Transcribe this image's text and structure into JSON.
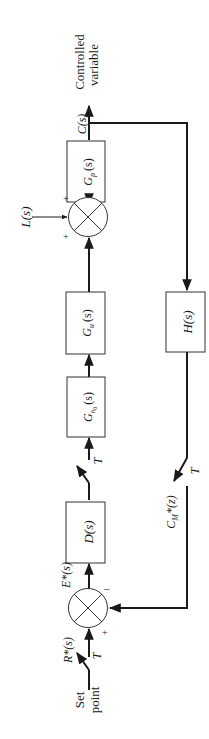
{
  "diagram": {
    "type": "sampled-data feedback control block diagram",
    "orientation": "rotated 90deg counter-clockwise",
    "blocks": {
      "gp": "G",
      "gp_sub": "p",
      "gp_arg": "(s)",
      "gu": "G",
      "gu_sub": "u",
      "gu_arg": "(s)",
      "gh0": "G",
      "gh0_sub": "h",
      "gh0_subsub": "0",
      "gh0_arg": "(s)",
      "d": "D(s)",
      "h": "H(s)"
    },
    "signals": {
      "output_symbol": "C(s)",
      "output_name_1": "Controlled",
      "output_name_2": "variable",
      "disturbance": "L(s)",
      "error": "E*(s)",
      "reference": "R*(s)",
      "setpoint_1": "Set",
      "setpoint_2": "point",
      "feedback_sampled": "C",
      "feedback_sampled_sub": "M",
      "feedback_sampled_rest": "*(z)"
    },
    "samplers": {
      "period_label": "T"
    },
    "signs": {
      "plus": "+",
      "minus": "–"
    }
  }
}
